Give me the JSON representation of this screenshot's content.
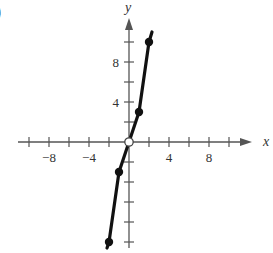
{
  "panel_label": ")",
  "chart_data": {
    "type": "line",
    "title": "",
    "xlabel": "x",
    "ylabel": "y",
    "xlim": [
      -11,
      11
    ],
    "ylim": [
      -11,
      11
    ],
    "x_ticks": [
      -10,
      -8,
      -6,
      -4,
      -2,
      2,
      4,
      6,
      8,
      10
    ],
    "y_ticks": [
      -10,
      -8,
      -6,
      -4,
      -2,
      2,
      4,
      6,
      8,
      10
    ],
    "x_tick_labels": [
      {
        "value": -8,
        "label": "−8"
      },
      {
        "value": -4,
        "label": "−4"
      },
      {
        "value": 4,
        "label": "4"
      },
      {
        "value": 8,
        "label": "8"
      }
    ],
    "y_tick_labels": [
      {
        "value": 4,
        "label": "4"
      },
      {
        "value": 8,
        "label": "8"
      }
    ],
    "grid": false,
    "series": [
      {
        "name": "right branch",
        "x": [
          0,
          1,
          2,
          2.3
        ],
        "y": [
          0,
          3,
          10,
          11
        ],
        "marker_points": [
          [
            1,
            3
          ],
          [
            2,
            10
          ]
        ]
      },
      {
        "name": "left branch",
        "x": [
          0,
          -1,
          -2,
          -2.2
        ],
        "y": [
          0,
          -3,
          -10,
          -10.6
        ],
        "marker_points": [
          [
            -1,
            -3
          ],
          [
            -2,
            -10
          ]
        ]
      }
    ],
    "open_points": [
      [
        0,
        0
      ]
    ],
    "annotations": []
  }
}
